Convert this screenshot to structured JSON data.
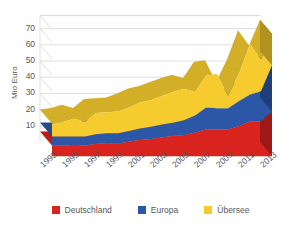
{
  "chart_data": {
    "type": "area",
    "stacked": true,
    "three_d": true,
    "title": "",
    "xlabel": "",
    "ylabel": "Mio Euro",
    "ylim": [
      0,
      78
    ],
    "yticks": [
      10,
      20,
      30,
      40,
      50,
      60,
      70
    ],
    "grid": true,
    "legend_position": "bottom",
    "x": [
      1993,
      1994,
      1995,
      1996,
      1997,
      1998,
      1999,
      2000,
      2001,
      2002,
      2003,
      2004,
      2005,
      2006,
      2007,
      2008,
      2009,
      2010,
      2011,
      2012,
      2013
    ],
    "xtick_labels": [
      "1993",
      "1995",
      "1997",
      "1999",
      "2001",
      "2003",
      "2005",
      "2007",
      "2009",
      "2011",
      "2013"
    ],
    "series": [
      {
        "name": "Deutschland",
        "color": "#d8231f",
        "values": [
          6.5,
          6.5,
          7.0,
          6.5,
          7.5,
          8.0,
          7.5,
          9.0,
          10.0,
          10.5,
          11.5,
          12.5,
          13.0,
          14.5,
          16.5,
          16.5,
          16.5,
          18.5,
          21.5,
          21.5,
          27.5
        ]
      },
      {
        "name": "Europa",
        "color": "#2b57a6",
        "values": [
          5.5,
          5.5,
          5.0,
          5.5,
          6.0,
          6.0,
          6.5,
          6.5,
          7.0,
          7.5,
          8.0,
          8.0,
          9.0,
          10.5,
          13.5,
          13.0,
          13.0,
          15.5,
          16.5,
          18.5,
          28.5
        ]
      },
      {
        "name": "Übersee",
        "color": "#f5cb2e",
        "values": [
          8.0,
          9.0,
          11.0,
          9.0,
          13.0,
          13.0,
          13.5,
          14.5,
          16.0,
          16.5,
          17.5,
          19.0,
          19.5,
          14.5,
          19.5,
          21.0,
          7.5,
          17.0,
          31.0,
          19.5,
          19.5
        ]
      }
    ],
    "totals": [
      20.0,
      21.0,
      23.0,
      21.0,
      26.5,
      27.0,
      27.5,
      30.0,
      33.0,
      34.5,
      37.0,
      39.5,
      41.5,
      39.5,
      49.5,
      50.5,
      37.0,
      51.0,
      69.0,
      59.5,
      75.5
    ]
  },
  "legend": {
    "items": [
      {
        "label": "Deutschland",
        "color": "#d8231f"
      },
      {
        "label": "Europa",
        "color": "#2b57a6"
      },
      {
        "label": "Übersee",
        "color": "#f5cb2e"
      }
    ]
  },
  "axes": {
    "y_title": "Mio Euro"
  }
}
